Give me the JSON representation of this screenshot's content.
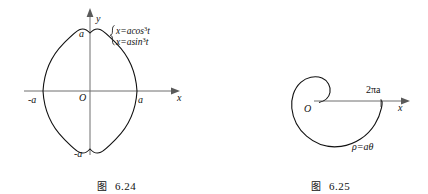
{
  "figures": [
    {
      "id": "figure-6-24",
      "caption_word": "图",
      "caption_number": "6.24",
      "curve_name": "astroid",
      "equations": [
        "x=acos",
        "x=asin"
      ],
      "equation_exponents": [
        "3",
        "3"
      ],
      "equation_params": [
        "t",
        "t"
      ],
      "axis_x_label": "x",
      "axis_y_label": "y",
      "origin_label": "O",
      "x_positive_label": "a",
      "x_negative_label": "-a",
      "y_positive_label": "a",
      "y_negative_label": "-a"
    },
    {
      "id": "figure-6-25",
      "caption_word": "图",
      "caption_number": "6.25",
      "curve_name": "archimedean-spiral",
      "polar_equation_lhs": "ρ",
      "polar_equation_rhs": "=aθ",
      "axis_x_label": "x",
      "origin_label": "O",
      "x_tick_label": "2πa"
    }
  ],
  "colors": {
    "background": "#ffffff",
    "curve_stroke": "#111111",
    "axis_stroke": "#6f6f6f",
    "text": "#1a1a1a"
  }
}
